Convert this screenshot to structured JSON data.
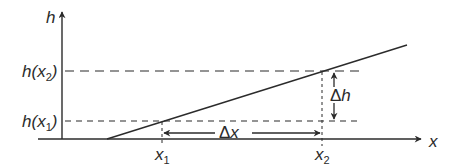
{
  "diagram": {
    "axes": {
      "y_label": "h",
      "x_label": "x"
    },
    "levels": {
      "h_x2": {
        "func": "h(",
        "var": "x",
        "sub": "2",
        "close": ")"
      },
      "h_x1": {
        "func": "h(",
        "var": "x",
        "sub": "1",
        "close": ")"
      }
    },
    "ticks": {
      "x1": {
        "var": "x",
        "sub": "1"
      },
      "x2": {
        "var": "x",
        "sub": "2"
      }
    },
    "deltas": {
      "dx": {
        "sym": "Δ",
        "var": "x"
      },
      "dh": {
        "sym": "Δ",
        "var": "h"
      }
    },
    "colors": {
      "line": "#2b2b2b",
      "background": "#ffffff"
    }
  }
}
